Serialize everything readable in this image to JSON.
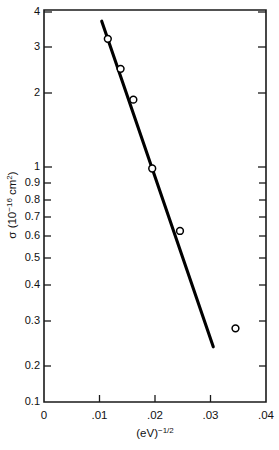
{
  "figure": {
    "background_color": "#ffffff",
    "ink_color": "#111111"
  },
  "chart_data": {
    "type": "scatter",
    "title": "",
    "xlabel": "(eV)-1/2",
    "xlabel_parts": {
      "base": "(eV)",
      "exponent": "-1/2"
    },
    "ylabel": "σ (10-16 cm2)",
    "ylabel_parts": {
      "symbol": "σ",
      "open": " (10",
      "exponent": "-16",
      "unit": " cm",
      "unit_exponent": "2",
      "close": ")"
    },
    "xscale": "linear",
    "yscale": "log",
    "xlim": [
      0,
      0.04
    ],
    "ylim": [
      0.1,
      4
    ],
    "grid": false,
    "legend": false,
    "xticks": [
      0,
      0.01,
      0.02,
      0.03,
      0.04
    ],
    "xtick_labels": [
      "0",
      ".01",
      ".02",
      ".03",
      ".04"
    ],
    "yticks": [
      0.1,
      0.2,
      0.3,
      0.4,
      0.5,
      0.6,
      0.7,
      0.8,
      0.9,
      1,
      2,
      3,
      4
    ],
    "ytick_labels": [
      "0.1",
      "0.2",
      "0.3",
      "0.4",
      "0.5",
      "0.6",
      "0.7",
      "0.8",
      "0.9",
      "1",
      "2",
      "3",
      "4"
    ],
    "ytick_labeled": [
      true,
      true,
      true,
      true,
      true,
      true,
      true,
      true,
      true,
      true,
      true,
      true,
      true
    ],
    "series": [
      {
        "name": "data",
        "marker": "open-circle",
        "x": [
          0.0115,
          0.0138,
          0.0161,
          0.0195,
          0.0245,
          0.0345
        ],
        "y": [
          3.05,
          2.3,
          1.72,
          0.9,
          0.5,
          0.2
        ]
      },
      {
        "name": "fit-line",
        "type": "line",
        "x": [
          0.0104,
          0.0305
        ],
        "y": [
          3.6,
          0.168
        ]
      }
    ]
  },
  "axis": {
    "x_title": "(eV)",
    "x_title_exponent": "−1/2",
    "y_symbol": "σ",
    "y_open": " (10",
    "y_exp": "−16",
    "y_unit": " cm",
    "y_unit_exp": "2",
    "y_close": ")"
  }
}
